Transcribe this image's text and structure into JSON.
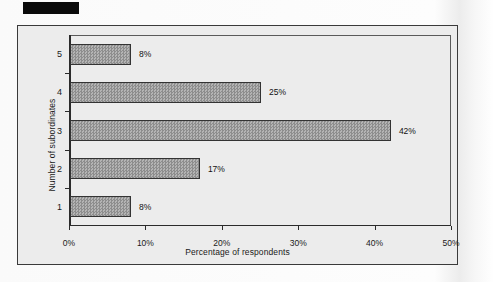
{
  "document": {
    "redaction_label": ""
  },
  "chart_data": {
    "type": "bar",
    "orientation": "horizontal",
    "title": "",
    "xlabel": "Percentage of respondents",
    "ylabel": "Number of subordinates",
    "categories": [
      "1",
      "2",
      "3",
      "4",
      "5"
    ],
    "values": [
      8,
      17,
      42,
      25,
      8
    ],
    "data_labels": [
      "8%",
      "17%",
      "42%",
      "25%",
      "8%"
    ],
    "xlim": [
      0,
      50
    ],
    "xticks": [
      0,
      10,
      20,
      30,
      40,
      50
    ],
    "xticklabels": [
      "0%",
      "10%",
      "20%",
      "30%",
      "40%",
      "50%"
    ],
    "grid": false,
    "legend": null,
    "colors": {
      "bar_fill": "#9a9a9a",
      "bar_border": "#333333",
      "plot_background": "#ececec",
      "frame_border": "#3a3a3a",
      "text": "#1a1a1a"
    }
  }
}
